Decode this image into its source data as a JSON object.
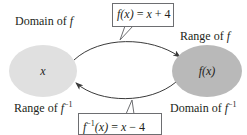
{
  "diagram": {
    "type": "function-inverse-mapping",
    "left_set": {
      "top_label_prefix": "Domain of ",
      "top_label_var": "f",
      "bottom_label_prefix": "Range of ",
      "bottom_label_var": "f",
      "bottom_label_sup": "−1",
      "element": "x",
      "fill": "#e0e0e0"
    },
    "right_set": {
      "top_label_prefix": "Range of ",
      "top_label_var": "f",
      "bottom_label_prefix": "Domain of ",
      "bottom_label_var": "f",
      "bottom_label_sup": "−1",
      "element": "f(x)",
      "fill": "#b9b9b9"
    },
    "forward_function": {
      "lhs": "f(x)",
      "equals": " = ",
      "rhs_var": "x",
      "rhs_rest": " + 4",
      "direction": "left-to-right"
    },
    "inverse_function": {
      "lhs_f": "f",
      "lhs_sup": "−1",
      "lhs_arg": "(x)",
      "equals": " = ",
      "rhs_var": "x",
      "rhs_rest": " − 4",
      "direction": "right-to-left"
    },
    "line_color": "#3a3a3a"
  }
}
